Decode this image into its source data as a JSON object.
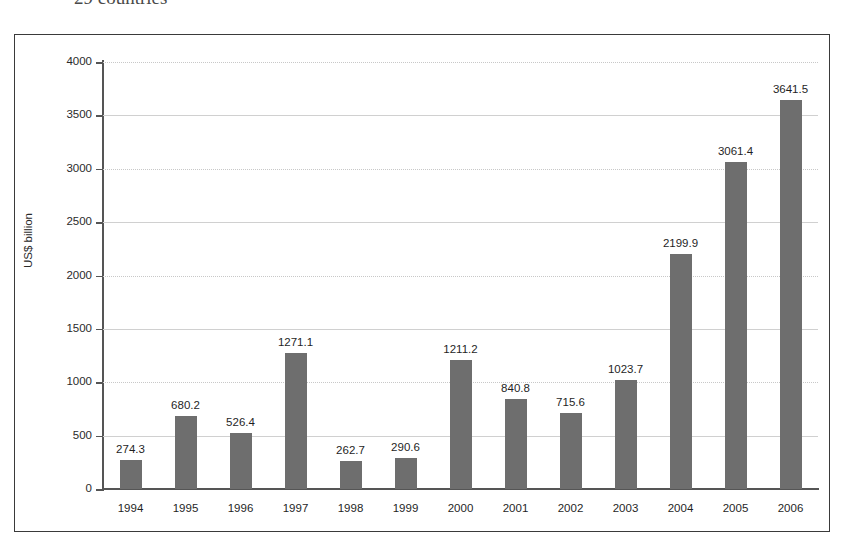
{
  "caption": {
    "text": "29 countries"
  },
  "chart_data": {
    "type": "bar",
    "title": "",
    "xlabel": "",
    "ylabel": "US$ billion",
    "categories": [
      "1994",
      "1995",
      "1996",
      "1997",
      "1998",
      "1999",
      "2000",
      "2001",
      "2002",
      "2003",
      "2004",
      "2005",
      "2006"
    ],
    "values": [
      274.3,
      680.2,
      526.4,
      1271.1,
      262.7,
      290.6,
      1211.2,
      840.8,
      715.6,
      1023.7,
      2199.9,
      3061.4,
      3641.5
    ],
    "data_labels": [
      "274.3",
      "680.2",
      "526.4",
      "1271.1",
      "262.7",
      "290.6",
      "1211.2",
      "840.8",
      "715.6",
      "1023.7",
      "2199.9",
      "3061.4",
      "3641.5"
    ],
    "ylim": [
      0,
      4000
    ],
    "ytick_values": [
      0,
      500,
      1000,
      1500,
      2000,
      2500,
      3000,
      3500,
      4000
    ],
    "ytick_labels": [
      "0",
      "500",
      "1000",
      "1500",
      "2000",
      "2500",
      "3000",
      "3500",
      "4000"
    ],
    "grid": true,
    "legend": null,
    "legend_position": "none",
    "bar_color": "#6e6e6e",
    "axis_color": "#555555",
    "grid_color": "#d0d0d0",
    "plot_background": "#ffffff"
  }
}
